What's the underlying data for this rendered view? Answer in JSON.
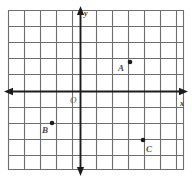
{
  "figure": {
    "kind": "coordinate-plane-grid",
    "origin_label": "O",
    "x_axis_label": "x",
    "y_axis_label": "y",
    "grid": {
      "columns": 11,
      "rows": 10,
      "cell_size_px": 16,
      "left_px": 8,
      "top_px": 10,
      "right_px": 184,
      "bottom_px": 170,
      "line_color": "#6b6b6b",
      "background_color": "#ffffff"
    },
    "axes": {
      "color": "#1a1a1a",
      "origin_px": {
        "x": 80,
        "y": 91
      },
      "x_axis_y_px": 91,
      "y_axis_x_px": 80,
      "x_left_end_px": 4,
      "x_right_end_px": 188,
      "y_top_end_px": 6,
      "y_bottom_end_px": 175
    },
    "points": [
      {
        "name": "A",
        "label": "A",
        "px": {
          "x": 130,
          "y": 62
        },
        "coords": {
          "x": 3,
          "y": 2
        },
        "label_px": {
          "x": 118,
          "y": 64
        }
      },
      {
        "name": "B",
        "label": "B",
        "px": {
          "x": 52,
          "y": 123
        },
        "coords": {
          "x": -2,
          "y": -2
        },
        "label_px": {
          "x": 42,
          "y": 126
        }
      },
      {
        "name": "C",
        "label": "C",
        "px": {
          "x": 143,
          "y": 140
        },
        "coords": {
          "x": 4,
          "y": -3
        },
        "label_px": {
          "x": 146,
          "y": 145
        }
      }
    ]
  }
}
